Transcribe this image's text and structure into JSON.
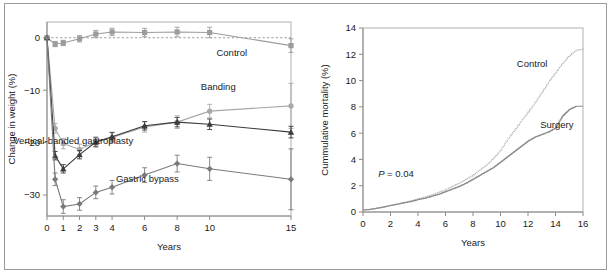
{
  "figure": {
    "background_color": "#ffffff",
    "frame_color": "#9a9a9a"
  },
  "chart_data": [
    {
      "id": "weight-change",
      "type": "line",
      "title": "",
      "xlabel": "Years",
      "ylabel": "Change in weight (%)",
      "xlim": [
        0,
        15
      ],
      "ylim": [
        -34,
        3
      ],
      "xticks": [
        0,
        1,
        2,
        3,
        4,
        6,
        8,
        10,
        15
      ],
      "xtick_labels": [
        "0",
        "1",
        "2",
        "3",
        "4",
        "6",
        "8",
        "10",
        "15"
      ],
      "yticks": [
        0,
        -10,
        -20,
        -30
      ],
      "ytick_labels": [
        "0",
        "−10",
        "−20",
        "−30"
      ],
      "grid": false,
      "legend_position": "inline-annotations",
      "zero_reference_line": {
        "value": 0,
        "style": "dashed",
        "color": "#9b9b9b"
      },
      "x": [
        0,
        0.5,
        1,
        2,
        3,
        4,
        6,
        8,
        10,
        15
      ],
      "series": [
        {
          "name": "Control",
          "label": "Control",
          "marker": "square",
          "color": "#9c9c9c",
          "values": [
            0,
            -1.2,
            -1.0,
            -0.2,
            0.7,
            1.1,
            1.0,
            1.1,
            1.0,
            -1.5
          ],
          "errors": [
            0.0,
            0.5,
            0.5,
            0.6,
            0.7,
            0.7,
            0.8,
            0.9,
            1.0,
            1.3
          ],
          "label_x": 12.3,
          "label_y": -3.4
        },
        {
          "name": "Banding",
          "label": "Banding",
          "marker": "circle",
          "color": "#a8a8a8",
          "values": [
            0,
            -17.3,
            -20.2,
            -21.3,
            -19.9,
            -19.0,
            -17.0,
            -16.1,
            -14.0,
            -13.0
          ],
          "errors": [
            0.0,
            0.9,
            1.0,
            1.0,
            1.0,
            1.0,
            1.0,
            1.2,
            1.3,
            4.3
          ],
          "label_x": 11.6,
          "label_y": -10.0
        },
        {
          "name": "Vertical-banded gastroplasty",
          "label": "Vertical-banded gastroplasty",
          "marker": "triangle",
          "color": "#3b3b3b",
          "values": [
            0,
            -22.5,
            -25.0,
            -22.3,
            -19.9,
            -18.9,
            -16.8,
            -16.1,
            -16.5,
            -18.0
          ],
          "errors": [
            0.0,
            0.8,
            0.8,
            0.8,
            0.8,
            0.8,
            0.8,
            0.9,
            1.0,
            1.1
          ],
          "label_x": 5.3,
          "label_y": -20.3
        },
        {
          "name": "Gastric bypass",
          "label": "Gastric bypass",
          "marker": "diamond",
          "color": "#7a7a7a",
          "values": [
            0,
            -27.0,
            -32.2,
            -31.7,
            -29.5,
            -28.5,
            -26.2,
            -24.0,
            -25.0,
            -27.0
          ],
          "errors": [
            0.0,
            1.2,
            1.3,
            1.2,
            1.2,
            1.3,
            1.4,
            1.6,
            2.2,
            5.8
          ],
          "label_x": 8.1,
          "label_y": -27.6
        }
      ]
    },
    {
      "id": "cumulative-mortality",
      "type": "line",
      "title": "",
      "xlabel": "Years",
      "ylabel": "Cummulative mortality (%)",
      "xlim": [
        0,
        16
      ],
      "ylim": [
        0,
        14
      ],
      "xticks": [
        0,
        2,
        4,
        6,
        8,
        10,
        12,
        14,
        16
      ],
      "xtick_labels": [
        "0",
        "2",
        "4",
        "6",
        "8",
        "10",
        "12",
        "14",
        "16"
      ],
      "yticks": [
        0,
        2,
        4,
        6,
        8,
        10,
        12,
        14
      ],
      "ytick_labels": [
        "0",
        "2",
        "4",
        "6",
        "8",
        "10",
        "12",
        "14"
      ],
      "grid": false,
      "legend_position": "inline-annotations",
      "annotation": {
        "text_italic": "P",
        "text": " =  0.04",
        "x": 1.1,
        "y": 2.7
      },
      "x": [
        0,
        0.5,
        1,
        1.5,
        2,
        2.5,
        3,
        3.5,
        4,
        4.5,
        5,
        5.5,
        6,
        6.5,
        7,
        7.5,
        8,
        8.5,
        9,
        9.5,
        10,
        10.5,
        11,
        11.5,
        12,
        12.5,
        13,
        13.5,
        14,
        14.5,
        15,
        15.5,
        16
      ],
      "series": [
        {
          "name": "Control",
          "label": "Control",
          "style": "dotted",
          "color": "#b4b4b4",
          "values": [
            0.15,
            0.2,
            0.3,
            0.4,
            0.5,
            0.6,
            0.75,
            0.85,
            1.0,
            1.15,
            1.3,
            1.5,
            1.7,
            1.95,
            2.2,
            2.5,
            2.8,
            3.2,
            3.6,
            4.1,
            4.7,
            5.5,
            6.2,
            6.9,
            7.6,
            8.3,
            9.1,
            9.9,
            10.6,
            11.3,
            11.9,
            12.3,
            12.4
          ],
          "label_x": 12.3,
          "label_y": 11.0
        },
        {
          "name": "Surgery",
          "label": "Surgery",
          "style": "solid",
          "color": "#8a8a8a",
          "values": [
            0.15,
            0.2,
            0.28,
            0.38,
            0.5,
            0.6,
            0.7,
            0.8,
            0.95,
            1.05,
            1.2,
            1.35,
            1.55,
            1.75,
            1.95,
            2.2,
            2.5,
            2.8,
            3.1,
            3.4,
            3.8,
            4.2,
            4.6,
            5.0,
            5.4,
            5.7,
            5.9,
            6.1,
            6.4,
            7.3,
            7.8,
            8.05,
            8.05
          ],
          "label_x": 14.1,
          "label_y": 6.4
        }
      ]
    }
  ]
}
